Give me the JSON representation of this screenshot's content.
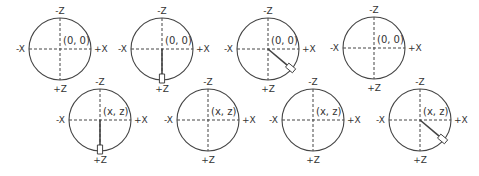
{
  "diagram": {
    "style": {
      "stroke": "#444444",
      "text": "#333333",
      "background": "#ffffff"
    },
    "axis_labels": {
      "neg_z": "-Z",
      "pos_z": "+Z",
      "neg_x": "-X",
      "pos_x": "+X"
    },
    "dials": [
      {
        "id": 1,
        "row": 1,
        "cx": 60,
        "cy": 49,
        "r": 31,
        "center_label": "(0, 0)",
        "pointer": null
      },
      {
        "id": 2,
        "row": 1,
        "cx": 162,
        "cy": 49,
        "r": 31,
        "center_label": "(0, 0)",
        "pointer": {
          "angle_deg": 90
        }
      },
      {
        "id": 3,
        "row": 1,
        "cx": 268,
        "cy": 49,
        "r": 31,
        "center_label": "(0, 0)",
        "pointer": {
          "angle_deg": 40
        }
      },
      {
        "id": 4,
        "row": 1,
        "cx": 374,
        "cy": 48,
        "r": 31,
        "center_label": "(0, 0)",
        "pointer": null
      },
      {
        "id": 5,
        "row": 2,
        "cx": 100,
        "cy": 120,
        "r": 31,
        "center_label": "(x, z)",
        "pointer": {
          "angle_deg": 90
        }
      },
      {
        "id": 6,
        "row": 2,
        "cx": 208,
        "cy": 120,
        "r": 31,
        "center_label": "(x, z)",
        "pointer": null
      },
      {
        "id": 7,
        "row": 2,
        "cx": 313,
        "cy": 120,
        "r": 31,
        "center_label": "(x, z)",
        "pointer": null
      },
      {
        "id": 8,
        "row": 2,
        "cx": 420,
        "cy": 120,
        "r": 31,
        "center_label": "(x, z)",
        "pointer": {
          "angle_deg": 40
        }
      }
    ]
  }
}
